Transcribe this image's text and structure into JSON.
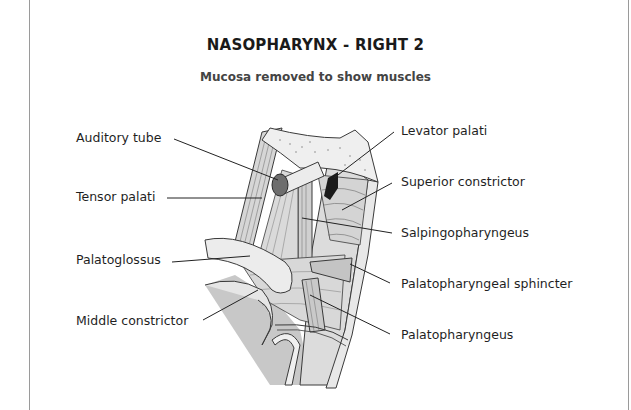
{
  "figure": {
    "title": "NASOPHARYNX - RIGHT 2",
    "subtitle": "Mucosa removed to show muscles"
  },
  "labels": {
    "left": [
      {
        "id": "auditory-tube",
        "text": "Auditory tube"
      },
      {
        "id": "tensor-palati",
        "text": "Tensor palati"
      },
      {
        "id": "palatoglossus",
        "text": "Palatoglossus"
      },
      {
        "id": "middle-constrictor",
        "text": "Middle constrictor"
      }
    ],
    "right": [
      {
        "id": "levator-palati",
        "text": "Levator palati"
      },
      {
        "id": "superior-constrictor",
        "text": "Superior constrictor"
      },
      {
        "id": "salpingopharyngeus",
        "text": "Salpingopharyngeus"
      },
      {
        "id": "palatopharyngeal-sphincter",
        "text": "Palatopharyngeal sphincter"
      },
      {
        "id": "palatopharyngeus",
        "text": "Palatopharyngeus"
      }
    ]
  },
  "colors": {
    "muscle_fill": "#d9d9d9",
    "muscle_light": "#ececec",
    "outline": "#3a3a3a",
    "cartilage_dark": "#6e6e6e",
    "opening_black": "#1a1a1a",
    "leader_line": "#222222"
  }
}
